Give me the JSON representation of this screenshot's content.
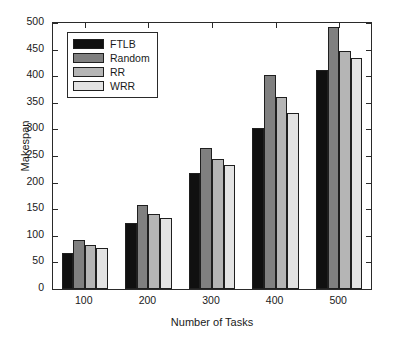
{
  "chart_data": {
    "type": "bar",
    "title": "",
    "xlabel": "Number of Tasks",
    "ylabel": "Makespan",
    "categories": [
      "100",
      "200",
      "300",
      "400",
      "500"
    ],
    "series": [
      {
        "name": "FTLB",
        "color": "#101010",
        "values": [
          68,
          125,
          218,
          303,
          412
        ]
      },
      {
        "name": "Random",
        "color": "#808080",
        "values": [
          93,
          158,
          266,
          402,
          492
        ]
      },
      {
        "name": "RR",
        "color": "#b5b5b5",
        "values": [
          83,
          141,
          245,
          361,
          448
        ]
      },
      {
        "name": "WRR",
        "color": "#e3e3e3",
        "values": [
          77,
          134,
          233,
          330,
          434
        ]
      }
    ],
    "ylim": [
      0,
      500
    ],
    "yticks": [
      0,
      50,
      100,
      150,
      200,
      250,
      300,
      350,
      400,
      450,
      500
    ],
    "ytick_labels": [
      "0",
      "50",
      "100",
      "150",
      "200",
      "250",
      "300",
      "350",
      "400",
      "450",
      "500"
    ],
    "xtick_labels": [
      "100",
      "200",
      "300",
      "400",
      "500"
    ],
    "grid": false,
    "legend_position": "top-left",
    "legend_entries": [
      "FTLB",
      "Random",
      "RR",
      "WRR"
    ]
  }
}
